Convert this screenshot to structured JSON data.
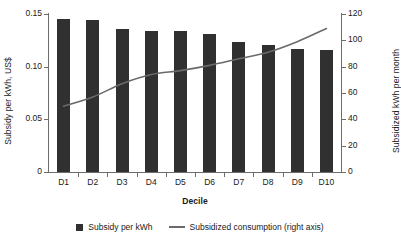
{
  "chart_data": {
    "type": "bar",
    "title": "",
    "subtitle": "",
    "xlabel": "Decile",
    "categories": [
      "D1",
      "D2",
      "D3",
      "D4",
      "D5",
      "D6",
      "D7",
      "D8",
      "D9",
      "D10"
    ],
    "grid": false,
    "legend_position": "bottom-center",
    "axes": {
      "left": {
        "label": "Subsidy per kWh, US$",
        "min": 0,
        "max": 0.15,
        "ticks": [
          0,
          0.05,
          0.1,
          0.15
        ],
        "tick_labels": [
          "0",
          "0.05",
          "0.10",
          "0.15"
        ]
      },
      "right": {
        "label": "Subsidized kWh per month",
        "min": 0,
        "max": 120,
        "ticks": [
          0,
          20,
          40,
          60,
          80,
          100,
          120
        ],
        "tick_labels": [
          "0",
          "20",
          "40",
          "60",
          "80",
          "100",
          "120"
        ]
      }
    },
    "series": [
      {
        "name": "Subsidy per kWh",
        "type": "bar",
        "axis": "left",
        "color": "#303030",
        "values": [
          0.145,
          0.144,
          0.136,
          0.134,
          0.134,
          0.131,
          0.123,
          0.121,
          0.117,
          0.116
        ]
      },
      {
        "name": "Subsidized consumption (right axis)",
        "type": "line",
        "axis": "right",
        "color": "#6a6a6a",
        "values": [
          50,
          57,
          67,
          74,
          77,
          81,
          86,
          91,
          99,
          109
        ]
      }
    ]
  },
  "legend": {
    "items": [
      {
        "label": "Subsidy per kWh",
        "marker": "square-marker"
      },
      {
        "label": "Subsidized consumption (right axis)",
        "marker": "line-marker"
      }
    ]
  }
}
